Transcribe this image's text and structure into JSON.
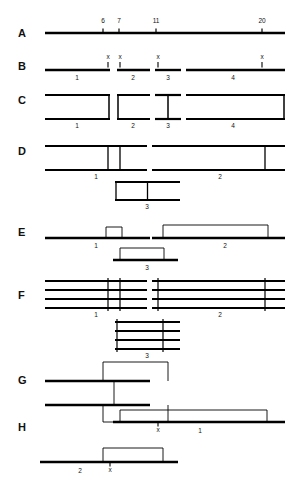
{
  "figure": {
    "title": "",
    "type": "schematic-diagram",
    "background": "#ffffff",
    "ink": "#000000",
    "width": 296,
    "height": 490
  },
  "row_labels": [
    {
      "id": "A",
      "text": "A",
      "x": 18,
      "y": 28
    },
    {
      "id": "B",
      "text": "B",
      "x": 18,
      "y": 61
    },
    {
      "id": "C",
      "text": "C",
      "x": 18,
      "y": 95
    },
    {
      "id": "D",
      "text": "D",
      "x": 18,
      "y": 146
    },
    {
      "id": "E",
      "text": "E",
      "x": 18,
      "y": 227
    },
    {
      "id": "F",
      "text": "F",
      "x": 18,
      "y": 290
    },
    {
      "id": "G",
      "text": "G",
      "x": 18,
      "y": 375
    },
    {
      "id": "H",
      "text": "H",
      "x": 18,
      "y": 422
    }
  ],
  "scale_ticks": [
    {
      "label": "6",
      "x": 103,
      "y": 18
    },
    {
      "label": "7",
      "x": 119,
      "y": 18
    },
    {
      "label": "11",
      "x": 156,
      "y": 18
    },
    {
      "label": "20",
      "x": 262,
      "y": 18
    }
  ],
  "rowA": {
    "label": "A",
    "description": "linear scale bar with tick marks",
    "line": {
      "x1": 45,
      "x2": 285,
      "y": 33
    },
    "tick_positions": [
      103,
      119,
      156,
      262
    ]
  },
  "rowB": {
    "label": "B",
    "description": "four line fragments separated by gaps, each ending in an x crossover mark",
    "segments": [
      {
        "n": "1",
        "x1": 45,
        "x2": 110,
        "y": 70,
        "num_x": 77,
        "num_y": 75
      },
      {
        "n": "2",
        "x1": 117,
        "x2": 150,
        "y": 70,
        "num_x": 133,
        "num_y": 75
      },
      {
        "n": "3",
        "x1": 155,
        "x2": 181,
        "y": 70,
        "num_x": 168,
        "num_y": 75
      },
      {
        "n": "4",
        "x1": 186,
        "x2": 285,
        "y": 70,
        "num_x": 233,
        "num_y": 75
      }
    ],
    "x_marks": [
      {
        "label": "x",
        "x": 108,
        "y": 54
      },
      {
        "label": "x",
        "x": 120,
        "y": 54
      },
      {
        "label": "x",
        "x": 158,
        "y": 54
      },
      {
        "label": "x",
        "x": 262,
        "y": 54
      }
    ]
  },
  "rowC": {
    "label": "C",
    "description": "four open duplex boxes matching the B fragments",
    "boxes": [
      {
        "n": "1",
        "x1": 45,
        "x2": 110,
        "y1": 95,
        "y2": 119,
        "vbar": "right",
        "num_x": 77,
        "num_y": 123
      },
      {
        "n": "2",
        "x1": 117,
        "x2": 150,
        "y1": 95,
        "y2": 119,
        "vbar": "left",
        "num_x": 133,
        "num_y": 123
      },
      {
        "n": "3",
        "x1": 155,
        "x2": 181,
        "y1": 95,
        "y2": 119,
        "vbar": "mid",
        "num_x": 168,
        "num_y": 123
      },
      {
        "n": "4",
        "x1": 186,
        "x2": 285,
        "y1": 95,
        "y2": 119,
        "vbar": "right",
        "num_x": 233,
        "num_y": 123
      }
    ]
  },
  "rowD": {
    "label": "D",
    "description": "two long duplexes with internal vertical bars, plus a short duplex 3 below",
    "boxes": [
      {
        "n": "1",
        "x1": 45,
        "x2": 147,
        "y1": 146,
        "y2": 170,
        "verticals": [
          108,
          120
        ],
        "num_x": 96,
        "num_y": 174
      },
      {
        "n": "2",
        "x1": 152,
        "x2": 285,
        "y1": 146,
        "y2": 170,
        "verticals": [
          265
        ],
        "num_x": 220,
        "num_y": 174
      },
      {
        "n": "3",
        "x1": 115,
        "x2": 180,
        "y1": 182,
        "y2": 200,
        "verticals": [],
        "num_x": 147,
        "num_y": 204
      }
    ]
  },
  "rowE": {
    "label": "E",
    "description": "baselines carrying raised open boxes (loop-out heteroduplex), plus box 3 below",
    "items": [
      {
        "n": "1",
        "line": {
          "x1": 45,
          "x2": 150,
          "y": 238
        },
        "box": {
          "x1": 106,
          "x2": 122,
          "y1": 227,
          "y2": 238
        },
        "num_x": 96,
        "num_y": 243
      },
      {
        "n": "2",
        "line": {
          "x1": 152,
          "x2": 285,
          "y": 238
        },
        "box": {
          "x1": 163,
          "x2": 268,
          "y1": 225,
          "y2": 238
        },
        "num_x": 225,
        "num_y": 243
      },
      {
        "n": "3",
        "line": {
          "x1": 113,
          "x2": 178,
          "y": 260
        },
        "box": {
          "x1": 120,
          "x2": 164,
          "y1": 248,
          "y2": 260
        },
        "num_x": 147,
        "num_y": 265
      }
    ]
  },
  "rowF": {
    "label": "F",
    "description": "multi-stranded (four-line) duplex groups with vertical cross-links",
    "groups": [
      {
        "n": "1",
        "x1": 45,
        "x2": 147,
        "lines_y": [
          281,
          290,
          299,
          308
        ],
        "verticals": [
          108,
          120
        ],
        "num_x": 96,
        "num_y": 312
      },
      {
        "n": "2",
        "x1": 152,
        "x2": 285,
        "lines_y": [
          281,
          290,
          299,
          308
        ],
        "verticals": [
          158,
          265
        ],
        "num_x": 220,
        "num_y": 312
      },
      {
        "n": "3",
        "x1": 115,
        "x2": 180,
        "lines_y": [
          322,
          331,
          340,
          349
        ],
        "verticals": [
          117,
          163
        ],
        "num_x": 147,
        "num_y": 353
      }
    ]
  },
  "rowG": {
    "label": "G",
    "description": "two baselines with overlapping raised boxes joined by a vertical crossover strand",
    "lines": [
      {
        "x1": 45,
        "x2": 150,
        "y": 381
      },
      {
        "x1": 45,
        "x2": 150,
        "y": 405
      }
    ],
    "boxes": [
      {
        "x1": 103,
        "x2": 168,
        "y1": 362,
        "y2": 381
      },
      {
        "x1": 103,
        "x2": 168,
        "y1": 405,
        "y2": 422
      }
    ],
    "crossover": {
      "x": 114,
      "y1": 381,
      "y2": 405
    }
  },
  "rowH": {
    "label": "H",
    "description": "two recombinant molecules each with a raised box and an x crossover point",
    "items": [
      {
        "n": "1",
        "line": {
          "x1": 113,
          "x2": 285,
          "y": 422
        },
        "box": {
          "x1": 120,
          "x2": 267,
          "y1": 410,
          "y2": 422
        },
        "num_x": 200,
        "num_y": 428,
        "x_mark": {
          "label": "x",
          "x": 158,
          "y": 427
        }
      },
      {
        "n": "2",
        "line": {
          "x1": 40,
          "x2": 178,
          "y": 462
        },
        "box": {
          "x1": 103,
          "x2": 163,
          "y1": 448,
          "y2": 462
        },
        "num_x": 80,
        "num_y": 468,
        "x_mark": {
          "label": "x",
          "x": 110,
          "y": 467
        }
      }
    ]
  },
  "numbers_seen": [
    "1",
    "2",
    "3",
    "4",
    "6",
    "7",
    "11",
    "20"
  ],
  "x_marker_text": "x"
}
